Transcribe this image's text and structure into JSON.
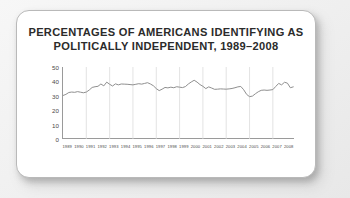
{
  "card": {
    "title_line_1": "PERCENTAGES OF AMERICANS IDENTIFYING AS",
    "title_line_2": "POLITICALLY INDEPENDENT, 1989–2008"
  },
  "colors": {
    "card_background": "#ffffff",
    "card_border": "#b9b9b9",
    "page_background": "#f0f0f0",
    "title_text": "#2b2b2b",
    "axis": "#9a9a9a",
    "gridline": "#dcdcdc",
    "series_line": "#8f8f8f",
    "tick_text": "#4a4a4a"
  },
  "chart_data": {
    "type": "line",
    "title": "PERCENTAGES OF AMERICANS IDENTIFYING AS POLITICALLY INDEPENDENT, 1989–2008",
    "xlabel": "",
    "ylabel": "",
    "ylim": [
      0,
      50
    ],
    "yticks": [
      0,
      10,
      20,
      30,
      40,
      50
    ],
    "xlim": [
      1989,
      2008.9
    ],
    "categories": [
      "1989",
      "1990",
      "1991",
      "1992",
      "1993",
      "1994",
      "1995",
      "1996",
      "1997",
      "1998",
      "1999",
      "2000",
      "2001",
      "2002",
      "2003",
      "2004",
      "2005",
      "2006",
      "2007",
      "2008"
    ],
    "grid": true,
    "grid_axis": "x",
    "legend": false,
    "series": [
      {
        "name": "Politically Independent",
        "x": [
          1989.0,
          1989.25,
          1989.5,
          1989.75,
          1990.0,
          1990.25,
          1990.5,
          1990.75,
          1991.0,
          1991.25,
          1991.5,
          1991.75,
          1992.0,
          1992.25,
          1992.5,
          1992.75,
          1993.0,
          1993.25,
          1993.5,
          1993.75,
          1994.0,
          1994.25,
          1994.5,
          1994.75,
          1995.0,
          1995.25,
          1995.5,
          1995.75,
          1996.0,
          1996.25,
          1996.5,
          1996.75,
          1997.0,
          1997.25,
          1997.5,
          1997.75,
          1998.0,
          1998.25,
          1998.5,
          1998.75,
          1999.0,
          1999.25,
          1999.5,
          1999.75,
          2000.0,
          2000.25,
          2000.5,
          2000.75,
          2001.0,
          2001.25,
          2001.5,
          2001.75,
          2002.0,
          2002.25,
          2002.5,
          2002.75,
          2003.0,
          2003.25,
          2003.5,
          2003.75,
          2004.0,
          2004.25,
          2004.5,
          2004.75,
          2005.0,
          2005.25,
          2005.5,
          2005.75,
          2006.0,
          2006.25,
          2006.5,
          2006.75,
          2007.0,
          2007.25,
          2007.5,
          2007.75,
          2008.0,
          2008.25,
          2008.5,
          2008.75
        ],
        "values": [
          30.2,
          31.0,
          32.3,
          32.6,
          32.4,
          32.9,
          32.5,
          32.1,
          32.6,
          34.0,
          35.8,
          36.3,
          36.6,
          38.2,
          36.9,
          39.5,
          38.0,
          36.8,
          38.3,
          37.6,
          38.2,
          38.1,
          38.0,
          37.8,
          37.6,
          38.0,
          38.4,
          38.1,
          38.6,
          39.1,
          38.2,
          37.0,
          35.0,
          33.6,
          34.6,
          35.8,
          35.5,
          36.0,
          35.6,
          36.3,
          36.0,
          35.7,
          36.4,
          38.2,
          39.6,
          40.8,
          39.5,
          37.8,
          36.6,
          35.0,
          36.2,
          35.4,
          34.5,
          34.6,
          34.8,
          34.7,
          34.6,
          34.8,
          35.1,
          35.6,
          36.2,
          36.5,
          34.2,
          31.0,
          29.4,
          29.8,
          31.4,
          32.8,
          33.8,
          34.0,
          33.8,
          34.0,
          34.3,
          36.5,
          38.6,
          37.6,
          39.4,
          38.8,
          35.6,
          36.2
        ]
      }
    ]
  }
}
